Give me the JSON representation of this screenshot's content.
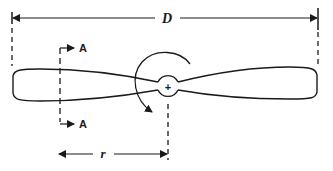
{
  "figure": {
    "type": "propeller-geometry-diagram",
    "labels": {
      "diameter": "D",
      "radius": "r",
      "section_top": "A",
      "section_bottom": "A",
      "hub_center": "+"
    },
    "colors": {
      "stroke": "#1a1a1a",
      "background": "#ffffff"
    }
  }
}
